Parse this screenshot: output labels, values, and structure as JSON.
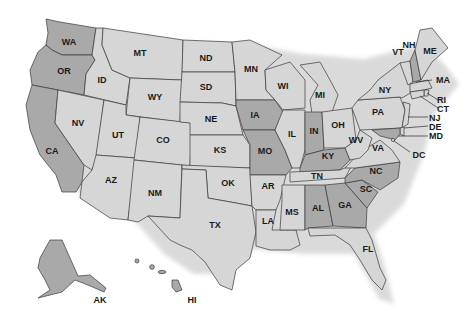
{
  "map": {
    "title": "United States",
    "colors": {
      "light": "#d6d6d6",
      "dark": "#a9a9a9",
      "border": "#3a3a3a",
      "label": "#1a1a1a"
    },
    "states": [
      {
        "abbr": "WA",
        "shade": "dark"
      },
      {
        "abbr": "OR",
        "shade": "dark"
      },
      {
        "abbr": "CA",
        "shade": "dark"
      },
      {
        "abbr": "ID",
        "shade": "light"
      },
      {
        "abbr": "NV",
        "shade": "light"
      },
      {
        "abbr": "MT",
        "shade": "light"
      },
      {
        "abbr": "WY",
        "shade": "light"
      },
      {
        "abbr": "UT",
        "shade": "light"
      },
      {
        "abbr": "AZ",
        "shade": "light"
      },
      {
        "abbr": "CO",
        "shade": "light"
      },
      {
        "abbr": "NM",
        "shade": "light"
      },
      {
        "abbr": "ND",
        "shade": "light"
      },
      {
        "abbr": "SD",
        "shade": "light"
      },
      {
        "abbr": "NE",
        "shade": "light"
      },
      {
        "abbr": "KS",
        "shade": "light"
      },
      {
        "abbr": "OK",
        "shade": "light"
      },
      {
        "abbr": "TX",
        "shade": "light"
      },
      {
        "abbr": "MN",
        "shade": "light"
      },
      {
        "abbr": "IA",
        "shade": "dark"
      },
      {
        "abbr": "MO",
        "shade": "dark"
      },
      {
        "abbr": "AR",
        "shade": "light"
      },
      {
        "abbr": "LA",
        "shade": "light"
      },
      {
        "abbr": "WI",
        "shade": "light"
      },
      {
        "abbr": "IL",
        "shade": "light"
      },
      {
        "abbr": "MI",
        "shade": "light"
      },
      {
        "abbr": "IN",
        "shade": "dark"
      },
      {
        "abbr": "OH",
        "shade": "light"
      },
      {
        "abbr": "KY",
        "shade": "dark"
      },
      {
        "abbr": "TN",
        "shade": "light"
      },
      {
        "abbr": "MS",
        "shade": "light"
      },
      {
        "abbr": "AL",
        "shade": "dark"
      },
      {
        "abbr": "GA",
        "shade": "dark"
      },
      {
        "abbr": "FL",
        "shade": "light"
      },
      {
        "abbr": "SC",
        "shade": "dark"
      },
      {
        "abbr": "NC",
        "shade": "dark"
      },
      {
        "abbr": "VA",
        "shade": "light"
      },
      {
        "abbr": "WV",
        "shade": "light"
      },
      {
        "abbr": "PA",
        "shade": "light"
      },
      {
        "abbr": "NY",
        "shade": "light"
      },
      {
        "abbr": "VT",
        "shade": "light"
      },
      {
        "abbr": "NH",
        "shade": "dark"
      },
      {
        "abbr": "ME",
        "shade": "light"
      },
      {
        "abbr": "MA",
        "shade": "light"
      },
      {
        "abbr": "RI",
        "shade": "light"
      },
      {
        "abbr": "CT",
        "shade": "light"
      },
      {
        "abbr": "NJ",
        "shade": "light"
      },
      {
        "abbr": "DE",
        "shade": "light"
      },
      {
        "abbr": "MD",
        "shade": "dark"
      },
      {
        "abbr": "DC",
        "shade": "light"
      },
      {
        "abbr": "AK",
        "shade": "dark"
      },
      {
        "abbr": "HI",
        "shade": "dark"
      }
    ],
    "labels": {
      "WA": "WA",
      "OR": "OR",
      "CA": "CA",
      "ID": "ID",
      "NV": "NV",
      "MT": "MT",
      "WY": "WY",
      "UT": "UT",
      "AZ": "AZ",
      "CO": "CO",
      "NM": "NM",
      "ND": "ND",
      "SD": "SD",
      "NE": "NE",
      "KS": "KS",
      "OK": "OK",
      "TX": "TX",
      "MN": "MN",
      "IA": "IA",
      "MO": "MO",
      "AR": "AR",
      "LA": "LA",
      "WI": "WI",
      "IL": "IL",
      "MI": "MI",
      "IN": "IN",
      "OH": "OH",
      "KY": "KY",
      "TN": "TN",
      "MS": "MS",
      "AL": "AL",
      "GA": "GA",
      "FL": "FL",
      "SC": "SC",
      "NC": "NC",
      "VA": "VA",
      "WV": "WV",
      "PA": "PA",
      "NY": "NY",
      "VT": "VT",
      "NH": "NH",
      "ME": "ME",
      "MA": "MA",
      "RI": "RI",
      "CT": "CT",
      "NJ": "NJ",
      "DE": "DE",
      "MD": "MD",
      "DC": "DC",
      "AK": "AK",
      "HI": "HI"
    }
  }
}
